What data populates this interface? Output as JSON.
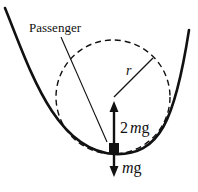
{
  "diagram": {
    "labels": {
      "passenger": "Passenger",
      "radius": "r",
      "normal_force_coef": "2",
      "normal_force_m": "m",
      "normal_force_g": "g",
      "weight_m": "m",
      "weight_g": "g"
    },
    "colors": {
      "ink": "#111111",
      "background": "#ffffff"
    },
    "elements": {
      "track": "U-shaped curved track (valley)",
      "circle": "dashed circle of curvature at the bottom of the valley",
      "passenger_box": "small filled square at lowest point of track",
      "upward_arrow": "normal force 2mg pointing up",
      "downward_arrow": "weight mg pointing down"
    }
  }
}
